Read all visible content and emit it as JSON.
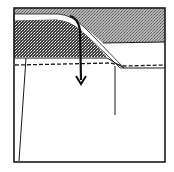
{
  "diagram": {
    "type": "geologic-cross-section",
    "labels": [],
    "colors": {
      "background": "#ffffff",
      "outline": "#1a1a1a",
      "upper_layer_fill": "#9a9a9a",
      "dense_layer_fill": "#4a4a4a",
      "highlight_band": "#ffffff",
      "arrow": "#111111"
    },
    "elements": [
      "frame",
      "upper-gray-layer",
      "dark-stippled-wedge",
      "white-curved-band",
      "dashed-horizon-line",
      "downward-arrow",
      "vertical-line-left",
      "vertical-line-right"
    ]
  }
}
